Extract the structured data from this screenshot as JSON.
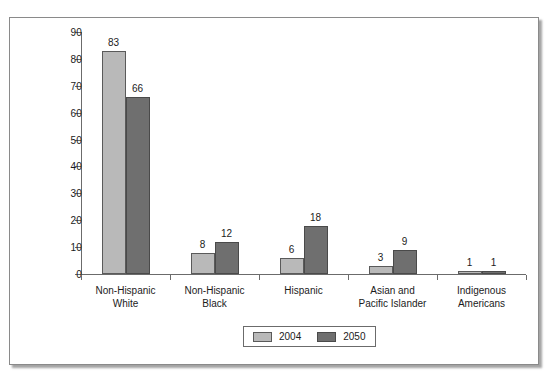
{
  "chart_data": {
    "type": "bar",
    "title": "",
    "subtitle": "",
    "xlabel": "",
    "ylabel": "",
    "ylim": [
      0,
      90
    ],
    "yticks": [
      0,
      10,
      20,
      30,
      40,
      50,
      60,
      70,
      80,
      90
    ],
    "grid": false,
    "legend_position": "bottom-center",
    "categories": [
      "Non-Hispanic\nWhite",
      "Non-Hispanic\nBlack",
      "Hispanic",
      "Asian and\nPacific Islander",
      "Indigenous\nAmericans"
    ],
    "category_lines": [
      [
        "Non-Hispanic",
        "White"
      ],
      [
        "Non-Hispanic",
        "Black"
      ],
      [
        "Hispanic",
        ""
      ],
      [
        "Asian and",
        "Pacific Islander"
      ],
      [
        "Indigenous",
        "Americans"
      ]
    ],
    "series": [
      {
        "name": "2004",
        "color": "#b9b9b9",
        "values": [
          83,
          8,
          6,
          3,
          1
        ]
      },
      {
        "name": "2050",
        "color": "#6f6f6f",
        "values": [
          66,
          12,
          18,
          9,
          1
        ]
      }
    ]
  },
  "legend": {
    "entries": [
      {
        "label": "2004",
        "color": "#b9b9b9"
      },
      {
        "label": "2050",
        "color": "#6f6f6f"
      }
    ]
  },
  "axis": {
    "y_tick_labels": [
      "90",
      "80",
      "70",
      "60",
      "50",
      "40",
      "30",
      "20",
      "10",
      "0"
    ]
  },
  "colors": {
    "series_2004": "#b9b9b9",
    "series_2050": "#6f6f6f",
    "axis": "#6b6b6b",
    "text": "#1b1b1b",
    "frame": "#8a8a8a",
    "background": "#ffffff"
  }
}
